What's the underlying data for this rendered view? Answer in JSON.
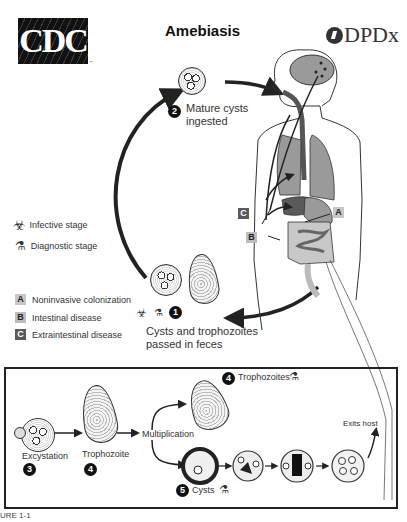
{
  "header": {
    "cdc_logo_text": "CDC",
    "cdc_logo_tm": "™",
    "title": "Amebiasis",
    "dpdx_logo_text": "DPDx"
  },
  "legend": {
    "infective_stage": "Infective stage",
    "diagnostic_stage": "Diagnostic stage",
    "items": [
      {
        "key": "A",
        "label": "Noninvasive colonization",
        "color": "#c8c8c8"
      },
      {
        "key": "B",
        "label": "Intestinal disease",
        "color": "#bdbdbd"
      },
      {
        "key": "C",
        "label": "Extraintestinal disease",
        "color": "#5a5a5a"
      }
    ]
  },
  "cycle": {
    "step1": {
      "number": "1",
      "label_line1": "Cysts and trophozoites",
      "label_line2": "passed in feces"
    },
    "step2": {
      "number": "2",
      "label_line1": "Mature cysts",
      "label_line2": "ingested"
    },
    "body_labels": {
      "a": "A",
      "b": "B",
      "c": "C"
    }
  },
  "lower_panel": {
    "excystation": {
      "label": "Excystation",
      "number": "3"
    },
    "trophozoite": {
      "label": "Trophozoite",
      "number": "4"
    },
    "multiplication": "Multiplication",
    "trophozoites": {
      "number": "4",
      "label": "Trophozoites"
    },
    "cysts": {
      "number": "5",
      "label": "Cysts"
    },
    "exits_host": "Exits host"
  },
  "caption": "URE 1-1",
  "icons": {
    "biohazard": "☣",
    "microscope": "🔬"
  },
  "colors": {
    "organ_gray": "#9a9a9a",
    "dark_gray": "#5a5a5a",
    "line": "#222222"
  }
}
